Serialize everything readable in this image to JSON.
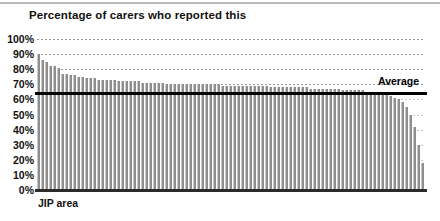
{
  "chart_data": {
    "type": "bar",
    "title": "Percentage of carers who reported this",
    "xlabel": "JIP area",
    "ylabel": "",
    "ylim": [
      0,
      100
    ],
    "ytick_labels": [
      "100%",
      "90%",
      "80%",
      "70%",
      "60%",
      "50%",
      "40%",
      "30%",
      "20%",
      "10%",
      "0%"
    ],
    "ytick_values": [
      100,
      90,
      80,
      70,
      60,
      50,
      40,
      30,
      20,
      10,
      0
    ],
    "grid": "horizontal-dotted",
    "legend": "none",
    "categories_note": "JIP areas, unlabelled, sorted descending",
    "series": [
      {
        "name": "Percentage of carers who reported this",
        "color": "#8e8e8e",
        "values": [
          90,
          86,
          85,
          82,
          82,
          81,
          77,
          77,
          76,
          76,
          75,
          75,
          74,
          74,
          74,
          73,
          73,
          73,
          73,
          73,
          72,
          72,
          72,
          72,
          72,
          72,
          71,
          71,
          71,
          71,
          71,
          71,
          70,
          70,
          70,
          70,
          70,
          70,
          70,
          70,
          70,
          70,
          70,
          70,
          70,
          70,
          69,
          69,
          69,
          69,
          69,
          69,
          69,
          69,
          69,
          69,
          69,
          69,
          68,
          68,
          68,
          68,
          68,
          68,
          68,
          68,
          68,
          68,
          67,
          67,
          67,
          67,
          67,
          67,
          67,
          67,
          66,
          66,
          66,
          66,
          66,
          66,
          65,
          65,
          65,
          64,
          64,
          63,
          62,
          61,
          60,
          58,
          55,
          50,
          42,
          30,
          18
        ]
      }
    ],
    "annotations": [
      {
        "name": "average-line",
        "label": "Average",
        "value": 65,
        "color": "#000000",
        "style": "solid-horizontal-line",
        "label_position": "right-above"
      }
    ]
  },
  "axis": {
    "x_title": "JIP area"
  }
}
